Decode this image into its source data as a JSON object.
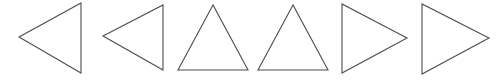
{
  "canvas": {
    "width": 502,
    "height": 80,
    "background_color": "#ffffff",
    "stroke_color": "#4d4d4d",
    "fill": "none",
    "stroke_width": 1.1
  },
  "diagram_data": {
    "type": "shape-row",
    "title": "",
    "shape_count": 6,
    "shape_kind": "triangle",
    "arrangement": "horizontal-row",
    "shapes": [
      {
        "index": 1,
        "name": "triangle-left-1",
        "orientation": "left",
        "points": "19,37 81,3 81,73",
        "vertices": [
          [
            19,
            37
          ],
          [
            81,
            3
          ],
          [
            81,
            73
          ]
        ],
        "apex": [
          19,
          37
        ],
        "base_edge": "vertical-right",
        "width": 62,
        "height": 70
      },
      {
        "index": 2,
        "name": "triangle-left-2",
        "orientation": "left",
        "points": "103,36 163,5 163,70",
        "vertices": [
          [
            103,
            36
          ],
          [
            163,
            5
          ],
          [
            163,
            70
          ]
        ],
        "apex": [
          103,
          36
        ],
        "base_edge": "vertical-right",
        "width": 60,
        "height": 65
      },
      {
        "index": 3,
        "name": "triangle-up-1",
        "orientation": "up",
        "points": "213,5 178,70 248,70",
        "vertices": [
          [
            213,
            5
          ],
          [
            178,
            70
          ],
          [
            248,
            70
          ]
        ],
        "apex": [
          213,
          5
        ],
        "base_edge": "horizontal-bottom",
        "width": 70,
        "height": 65
      },
      {
        "index": 4,
        "name": "triangle-up-2",
        "orientation": "up",
        "points": "293,5 258,70 328,70",
        "vertices": [
          [
            293,
            5
          ],
          [
            258,
            70
          ],
          [
            328,
            70
          ]
        ],
        "apex": [
          293,
          5
        ],
        "base_edge": "horizontal-bottom",
        "width": 70,
        "height": 65
      },
      {
        "index": 5,
        "name": "triangle-right-1",
        "orientation": "right",
        "points": "342,4 342,73 407,38",
        "vertices": [
          [
            342,
            4
          ],
          [
            342,
            73
          ],
          [
            407,
            38
          ]
        ],
        "apex": [
          407,
          38
        ],
        "base_edge": "vertical-left",
        "width": 65,
        "height": 69
      },
      {
        "index": 6,
        "name": "triangle-right-2",
        "orientation": "right",
        "points": "422,4 422,74 489,38",
        "vertices": [
          [
            422,
            4
          ],
          [
            422,
            74
          ],
          [
            489,
            38
          ]
        ],
        "apex": [
          489,
          38
        ],
        "base_edge": "vertical-left",
        "width": 67,
        "height": 70
      }
    ]
  }
}
